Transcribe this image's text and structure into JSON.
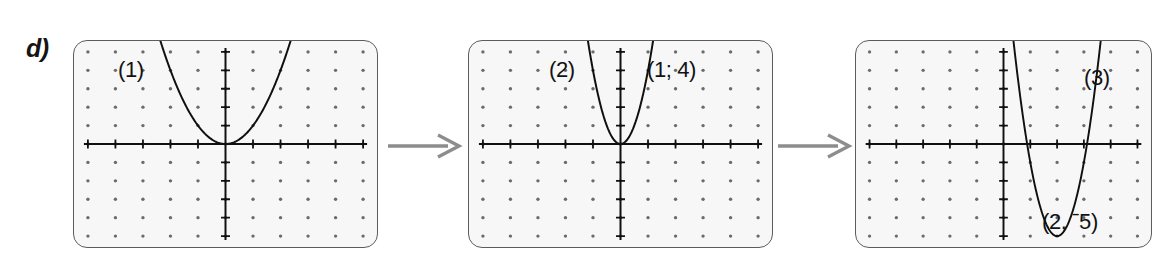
{
  "figure": {
    "part_label": "d)",
    "background_color": "#ffffff",
    "panel_fill_color": "#f7f7f7",
    "panel_border_color": "#5c5c5c",
    "grid_dot_color": "#6b6b6b",
    "axis_color": "#101010",
    "curve_color": "#101010",
    "arrow_color": "#8d8d8d"
  },
  "arrows": [
    {
      "name": "arrow-1",
      "glyph": "right-arrow",
      "from_panel": "(1)",
      "to_panel": "(2)"
    },
    {
      "name": "arrow-2",
      "glyph": "right-arrow",
      "from_panel": "(2)",
      "to_panel": "(3)"
    }
  ],
  "panels": [
    {
      "id": "panel-1",
      "number_label": "(1)",
      "point_label": "",
      "grid": {
        "cols": 11,
        "rows": 11,
        "x_range": [
          -5,
          5
        ],
        "y_range": [
          -5,
          5
        ],
        "ticks": true
      },
      "curve": {
        "type": "parabola",
        "a": 1,
        "vertex": [
          0,
          0
        ],
        "equation": "y = x^2"
      }
    },
    {
      "id": "panel-2",
      "number_label": "(2)",
      "point_label": "(1; 4)",
      "grid": {
        "cols": 11,
        "rows": 11,
        "x_range": [
          -5,
          5
        ],
        "y_range": [
          -5,
          5
        ],
        "ticks": true
      },
      "curve": {
        "type": "parabola",
        "a": 4,
        "vertex": [
          0,
          0
        ],
        "equation": "y = 4x^2"
      }
    },
    {
      "id": "panel-3",
      "number_label": "(3)",
      "point_label": "(2, ˉ5)",
      "grid": {
        "cols": 11,
        "rows": 11,
        "x_range": [
          -5,
          5
        ],
        "y_range": [
          -5,
          5
        ],
        "ticks": true
      },
      "curve": {
        "type": "parabola",
        "a": 4,
        "vertex": [
          2,
          -5
        ],
        "equation": "y = 4(x-2)^2 - 5"
      }
    }
  ],
  "chart_data": {
    "type": "line",
    "title": "",
    "xlabel": "",
    "ylabel": "",
    "xlim": [
      -5,
      5
    ],
    "ylim": [
      -5,
      5
    ],
    "grid": true,
    "legend": "none",
    "series": [
      {
        "name": "(1)",
        "panel": 1,
        "equation": "y = x^2",
        "vertex": [
          0,
          0
        ],
        "x": [
          -2.6,
          -2,
          -1.5,
          -1,
          -0.5,
          0,
          0.5,
          1,
          1.5,
          2,
          2.6
        ],
        "values": [
          6.76,
          4,
          2.25,
          1,
          0.25,
          0,
          0.25,
          1,
          2.25,
          4,
          6.76
        ]
      },
      {
        "name": "(2)",
        "panel": 2,
        "equation": "y = 4x^2",
        "vertex": [
          0,
          0
        ],
        "annotation": "(1; 4)",
        "x": [
          -1.3,
          -1,
          -0.75,
          -0.5,
          -0.25,
          0,
          0.25,
          0.5,
          0.75,
          1,
          1.3
        ],
        "values": [
          6.76,
          4,
          2.25,
          1,
          0.25,
          0,
          0.25,
          1,
          2.25,
          4,
          6.76
        ]
      },
      {
        "name": "(3)",
        "panel": 3,
        "equation": "y = 4(x-2)^2 - 5",
        "vertex": [
          2,
          -5
        ],
        "annotation": "(2, ˉ5)",
        "roots": [
          0.88,
          3.12
        ],
        "x": [
          0.7,
          1,
          1.25,
          1.5,
          1.75,
          2,
          2.25,
          2.5,
          2.75,
          3,
          3.3
        ],
        "values": [
          1.76,
          -1,
          -2.75,
          -4,
          -4.75,
          -5,
          -4.75,
          -4,
          -2.75,
          -1,
          1.76
        ]
      }
    ]
  }
}
